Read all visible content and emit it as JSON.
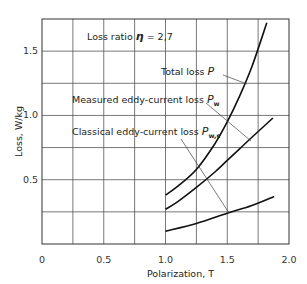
{
  "chart_data": {
    "type": "line",
    "title": "",
    "xlabel": "Polarization, T",
    "ylabel": "Loss, W/kg",
    "xlim": [
      0,
      2.0
    ],
    "ylim": [
      0,
      1.75
    ],
    "xticks": [
      "0",
      "0.5",
      "1.0",
      "1.5",
      "2.0"
    ],
    "yticks": [
      "0.5",
      "1.0",
      "1.5"
    ],
    "grid": true,
    "annotation": {
      "text_prefix": "Loss ratio ",
      "symbol": "η",
      "text_suffix": " = 2,7"
    },
    "series": [
      {
        "name": "Total loss P",
        "label_text": "Total loss",
        "symbol": "P",
        "sub": "",
        "x": [
          1.0,
          1.1,
          1.25,
          1.4,
          1.5,
          1.6,
          1.7,
          1.82
        ],
        "y": [
          0.38,
          0.45,
          0.58,
          0.78,
          0.95,
          1.15,
          1.38,
          1.72
        ]
      },
      {
        "name": "Measured eddy-current loss Pw",
        "label_text": "Measured eddy-current loss",
        "symbol": "P",
        "sub": "w",
        "x": [
          1.0,
          1.1,
          1.25,
          1.4,
          1.5,
          1.6,
          1.7,
          1.87
        ],
        "y": [
          0.27,
          0.33,
          0.44,
          0.56,
          0.65,
          0.74,
          0.83,
          0.98
        ]
      },
      {
        "name": "Classical eddy-current loss Pw,c",
        "label_text": "Classical eddy-current loss",
        "symbol": "P",
        "sub": "w,c",
        "x": [
          1.0,
          1.25,
          1.5,
          1.7,
          1.88
        ],
        "y": [
          0.1,
          0.16,
          0.24,
          0.3,
          0.37
        ]
      }
    ]
  }
}
